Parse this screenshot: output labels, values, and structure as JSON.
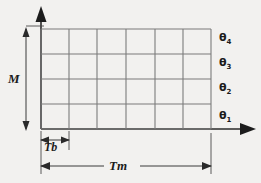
{
  "figure": {
    "name": "time-slot-grid-diagram",
    "background_color": "#f2f1ef",
    "line_color": "#7b7b7b",
    "axis_color": "#2a2a2a",
    "text_color": "#1b1b1b",
    "grid": {
      "columns": 6,
      "rows": 4,
      "left": 41,
      "right": 211,
      "top": 29,
      "bottom": 129,
      "column_x": [
        41,
        69,
        97,
        126,
        155,
        183,
        211
      ],
      "row_y": [
        29,
        54,
        79,
        104,
        129
      ]
    },
    "axes": {
      "origin_x": 41,
      "origin_y": 129,
      "vertical_top": 8,
      "horizontal_right": 255,
      "vertical_arrow": "up-arrowhead",
      "horizontal_arrow": "right-arrowhead"
    },
    "row_labels": [
      {
        "name": "theta-4",
        "symbol": "θ",
        "subscript": "4",
        "y": 39
      },
      {
        "name": "theta-3",
        "symbol": "θ",
        "subscript": "3",
        "y": 64
      },
      {
        "name": "theta-2",
        "symbol": "θ",
        "subscript": "2",
        "y": 89
      },
      {
        "name": "theta-1",
        "symbol": "θ",
        "subscript": "1",
        "y": 116
      }
    ],
    "dimensions": [
      {
        "name": "m-dimension",
        "label": "M",
        "orientation": "vertical",
        "from": 29,
        "to": 129,
        "axis_pos": 26,
        "label_x": 10,
        "label_y": 73
      },
      {
        "name": "tb-dimension",
        "label": "Tb",
        "orientation": "horizontal",
        "from": 41,
        "to": 69,
        "axis_pos": 142,
        "label_x": 44,
        "label_y": 145
      },
      {
        "name": "tm-dimension",
        "label": "Tm",
        "orientation": "horizontal",
        "from": 41,
        "to": 211,
        "axis_pos": 166,
        "label_x": 113,
        "label_y": 160
      }
    ]
  }
}
